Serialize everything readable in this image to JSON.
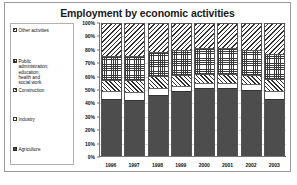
{
  "chart_data": {
    "type": "bar",
    "subtype": "stacked-100-percent",
    "title": "Employment by economic activities",
    "xlabel": "",
    "ylabel": "",
    "categories": [
      "1996",
      "1997",
      "1998",
      "1999",
      "2000",
      "2001",
      "2002",
      "2003"
    ],
    "ylim": [
      0,
      100
    ],
    "ytick_labels": [
      "100%",
      "90%",
      "80%",
      "70%",
      "60%",
      "50%",
      "40%",
      "30%",
      "20%",
      "10%",
      "0%"
    ],
    "ytick_values": [
      100,
      90,
      80,
      70,
      60,
      50,
      40,
      30,
      20,
      10,
      0
    ],
    "grid": true,
    "legend_position": "left",
    "series": [
      {
        "name": "Agriculture",
        "pattern": "solid-dark",
        "values": [
          43,
          42,
          46,
          49,
          51,
          51,
          50,
          43
        ]
      },
      {
        "name": "Industry",
        "pattern": "blank-white",
        "values": [
          6,
          6,
          5,
          4,
          4,
          4,
          4,
          6
        ]
      },
      {
        "name": "Construction",
        "pattern": "diagonal-hatch-right",
        "values": [
          8,
          9,
          9,
          8,
          7,
          7,
          7,
          9
        ]
      },
      {
        "name": "Public administration; education; health and social work",
        "pattern": "checkered-dots",
        "values": [
          18,
          18,
          18,
          19,
          19,
          19,
          19,
          19
        ]
      },
      {
        "name": "Other activities",
        "pattern": "diagonal-hatch-left",
        "values": [
          25,
          25,
          22,
          20,
          19,
          19,
          20,
          23
        ]
      }
    ]
  },
  "legend": {
    "items": [
      {
        "label": "Other activities",
        "lines": [
          "Other activities"
        ],
        "swatch": "hatchB",
        "top": 4
      },
      {
        "label": "Public administration; education; health and social work",
        "lines": [
          "Public",
          "administration;",
          "education;",
          "health and",
          "social work"
        ],
        "swatch": "dots",
        "top": 35
      },
      {
        "label": "Construction",
        "lines": [
          "Construction"
        ],
        "swatch": "hatchA",
        "top": 64
      },
      {
        "label": "Industry",
        "lines": [
          "Industry"
        ],
        "swatch": "blank",
        "top": 93
      },
      {
        "label": "Agriculture",
        "lines": [
          "Agriculture"
        ],
        "swatch": "solid",
        "top": 123
      }
    ]
  },
  "colors": {
    "frame_border": "#9a9a9a",
    "agriculture": "#4d4d4d",
    "industry": "#ffffff",
    "hatch_ink": "#2f2f2f",
    "gridline": "#d8d8d8",
    "axis": "#777777",
    "text": "#111111"
  }
}
